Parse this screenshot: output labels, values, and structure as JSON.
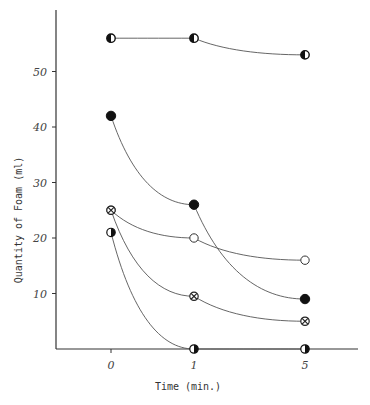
{
  "chart_data": {
    "type": "line",
    "title": "",
    "xlabel": "Time (min.)",
    "ylabel": "Quantity of Foam (ml)",
    "x": [
      0,
      1,
      5
    ],
    "x_tick_labels": [
      "0",
      "1",
      "5"
    ],
    "y_tick_labels": [
      "10",
      "20",
      "30",
      "40",
      "50"
    ],
    "y_ticks": [
      10,
      20,
      30,
      40,
      50
    ],
    "ylim": [
      0,
      62
    ],
    "grid": false,
    "legend": "none",
    "series": [
      {
        "name": "half-filled-left circle",
        "marker": "half-left",
        "values": [
          56,
          56,
          53
        ]
      },
      {
        "name": "filled circle",
        "marker": "filled",
        "values": [
          42,
          26,
          9
        ]
      },
      {
        "name": "open circle",
        "marker": "open",
        "values": [
          25,
          20,
          16
        ]
      },
      {
        "name": "crossed circle",
        "marker": "cross",
        "values": [
          25,
          9.5,
          5
        ]
      },
      {
        "name": "half-filled-right circle",
        "marker": "half-right",
        "values": [
          21,
          0,
          0
        ]
      }
    ]
  },
  "axes": {
    "xlabel": "Time (min.)",
    "ylabel": "Quantity of Foam (ml)"
  }
}
